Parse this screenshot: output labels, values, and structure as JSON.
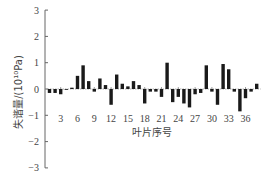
{
  "chart_data": {
    "type": "bar",
    "title": "",
    "xlabel": "叶片序号",
    "ylabel": "失谐量/(10¹⁰Pa)",
    "ylim": [
      -3,
      3
    ],
    "yticks": [
      -3,
      -2,
      -1,
      0,
      1,
      2,
      3
    ],
    "xticks": [
      3,
      6,
      9,
      12,
      15,
      18,
      21,
      24,
      27,
      30,
      33,
      36
    ],
    "grid": false,
    "legend": null,
    "categories": [
      1,
      2,
      3,
      4,
      5,
      6,
      7,
      8,
      9,
      10,
      11,
      12,
      13,
      14,
      15,
      16,
      17,
      18,
      19,
      20,
      21,
      22,
      23,
      24,
      25,
      26,
      27,
      28,
      29,
      30,
      31,
      32,
      33,
      34,
      35,
      36,
      37,
      38
    ],
    "values": [
      -0.15,
      -0.15,
      -0.2,
      0,
      0.05,
      0.5,
      0.9,
      0.3,
      -0.1,
      0.4,
      0.15,
      -0.6,
      0.55,
      0.2,
      0.1,
      0.3,
      0.15,
      -0.55,
      -0.1,
      -0.1,
      -0.3,
      1.0,
      -0.5,
      -0.3,
      -0.55,
      -0.7,
      -0.2,
      -0.15,
      0.9,
      -0.1,
      -0.6,
      0.95,
      0.75,
      -0.1,
      -0.85,
      -0.35,
      -0.1,
      0.2
    ],
    "bar_color": "#1a1a1a"
  }
}
